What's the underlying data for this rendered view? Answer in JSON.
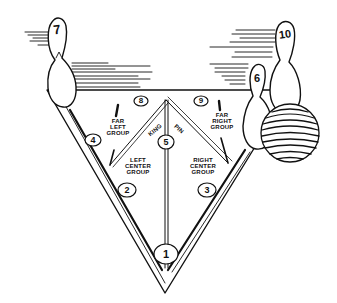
{
  "diagram": {
    "colors": {
      "ink": "#111111",
      "background": "#ffffff"
    },
    "pins": [
      {
        "number": "1",
        "position": "head-pin"
      },
      {
        "number": "2",
        "position": "left-center"
      },
      {
        "number": "3",
        "position": "right-center"
      },
      {
        "number": "4",
        "position": "far-left"
      },
      {
        "number": "5",
        "position": "kingpin"
      },
      {
        "number": "6",
        "position": "far-right-standing"
      },
      {
        "number": "7",
        "position": "far-left-corner-standing"
      },
      {
        "number": "8",
        "position": "back-left"
      },
      {
        "number": "9",
        "position": "back-right"
      },
      {
        "number": "10",
        "position": "far-right-corner-standing"
      }
    ],
    "labels": {
      "far_left_group": [
        "FAR",
        "LEFT",
        "GROUP"
      ],
      "far_right_group": [
        "FAR",
        "RIGHT",
        "GROUP"
      ],
      "left_center_group": [
        "LEFT",
        "CENTER",
        "GROUP"
      ],
      "right_center_group": [
        "RIGHT",
        "CENTER",
        "GROUP"
      ],
      "king_pin": [
        "KING",
        "PIN"
      ]
    },
    "standing_pins": {
      "pin7": "7",
      "pin10": "10",
      "pin6": "6"
    },
    "deck_pins": {
      "p1": "1",
      "p2": "2",
      "p3": "3",
      "p4": "4",
      "p5": "5",
      "p8": "8",
      "p9": "9"
    }
  }
}
